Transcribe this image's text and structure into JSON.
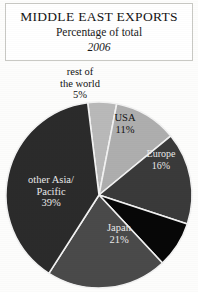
{
  "title": {
    "main": "MIDDLE EAST EXPORTS",
    "subtitle": "Percentage of total",
    "year": "2006"
  },
  "chart_data": {
    "type": "pie",
    "title": "MIDDLE EAST EXPORTS",
    "subtitle": "Percentage of total",
    "year": "2006",
    "unit": "percent",
    "legend": "none",
    "labels_placement": "inside-and-callout",
    "categories": [
      "rest of the world",
      "USA",
      "Europe",
      "unlabeled",
      "Japan",
      "other Asia/Pacific"
    ],
    "values": [
      5,
      11,
      16,
      8,
      21,
      39
    ],
    "colors": [
      "#b9b9b9",
      "#aeaeae",
      "#3a3a3a",
      "#070707",
      "#4a4a4a",
      "#2b2b2b"
    ],
    "start_angle_deg": -97,
    "separator_color": "#f2f2f2",
    "slices": [
      {
        "name": "rest of the world",
        "value": 5,
        "label": "rest of\nthe world\n5%",
        "color": "#b9b9b9"
      },
      {
        "name": "USA",
        "value": 11,
        "label": "USA\n11%",
        "color": "#aeaeae"
      },
      {
        "name": "Europe",
        "value": 16,
        "label": "Europe\n16%",
        "color": "#3a3a3a"
      },
      {
        "name": "unlabeled",
        "value": 8,
        "label": "",
        "color": "#070707"
      },
      {
        "name": "Japan",
        "value": 21,
        "label": "Japan\n21%",
        "color": "#4a4a4a"
      },
      {
        "name": "other Asia/Pacific",
        "value": 39,
        "label": "other Asia/\nPacific\n39%",
        "color": "#2b2b2b"
      }
    ]
  },
  "labels": {
    "rest": {
      "line1": "rest of",
      "line2": "the world",
      "line3": "5%"
    },
    "usa": {
      "line1": "USA",
      "line2": "11%"
    },
    "europe": {
      "line1": "Europe",
      "line2": "16%"
    },
    "japan": {
      "line1": "Japan",
      "line2": "21%"
    },
    "other": {
      "line1": "other Asia/",
      "line2": "Pacific",
      "line3": "39%"
    }
  }
}
